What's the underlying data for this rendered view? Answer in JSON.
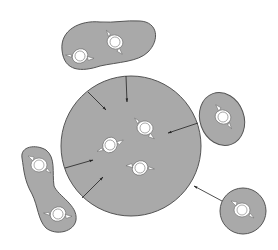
{
  "diagram": {
    "type": "top-down spatial diagram",
    "colors": {
      "fill": "#a9a9a9",
      "outline": "#555555",
      "figure": "#ffffff",
      "arrow": "#222222",
      "background": "#ffffff"
    },
    "central_group": {
      "shape": "circle",
      "people_count": 3,
      "incoming_arrows": 6
    },
    "peripheral_groups": [
      {
        "position": "top-left",
        "shape": "bean",
        "people_count": 2
      },
      {
        "position": "right",
        "shape": "oval",
        "people_count": 1
      },
      {
        "position": "left",
        "shape": "peanut",
        "people_count": 2
      },
      {
        "position": "bottom-right",
        "shape": "circle",
        "people_count": 1,
        "connected_by_arrow": true
      }
    ]
  },
  "caption": ""
}
